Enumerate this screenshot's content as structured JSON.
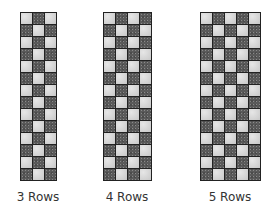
{
  "figure": {
    "panels": [
      {
        "label": "3 Rows",
        "columns": 3,
        "rows": 14,
        "first_cell": "light"
      },
      {
        "label": "4 Rows",
        "columns": 4,
        "rows": 14,
        "first_cell": "light"
      },
      {
        "label": "5 Rows",
        "columns": 5,
        "rows": 14,
        "first_cell": "light"
      }
    ],
    "colors": {
      "light": "#d4d4d4",
      "dark": "#5a5a5a",
      "grid": "#222222"
    }
  }
}
